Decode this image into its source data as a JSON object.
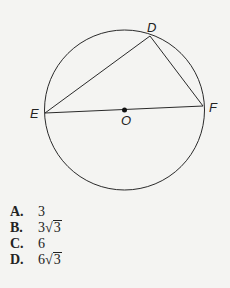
{
  "figure": {
    "points": {
      "D": {
        "label": "D",
        "x": 150,
        "y": 36
      },
      "E": {
        "label": "E",
        "x": 45,
        "y": 113
      },
      "F": {
        "label": "F",
        "x": 203,
        "y": 106
      },
      "O": {
        "label": "O",
        "x": 124,
        "y": 110
      }
    },
    "circle": {
      "cx": 124.5,
      "cy": 110,
      "r": 80
    },
    "stroke_color": "#2a2a2a"
  },
  "choices": [
    {
      "letter": "A.",
      "value": "3",
      "radical": ""
    },
    {
      "letter": "B.",
      "value": "3",
      "radical": "3"
    },
    {
      "letter": "C.",
      "value": "6",
      "radical": ""
    },
    {
      "letter": "D.",
      "value": "6",
      "radical": "3"
    }
  ]
}
